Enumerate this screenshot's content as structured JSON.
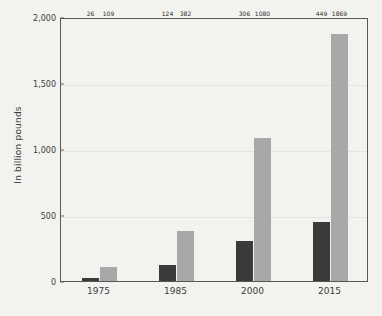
{
  "chart_data": {
    "type": "bar",
    "title": "",
    "subtitle": "",
    "xlabel": "",
    "ylabel": "In billion pounds",
    "categories": [
      "1975",
      "1985",
      "2000",
      "2015"
    ],
    "series": [
      {
        "name": "series-1",
        "color": "#3a3a3a",
        "values": [
          26,
          124,
          306,
          449
        ]
      },
      {
        "name": "series-2",
        "color": "#a8a8a8",
        "values": [
          109,
          382,
          1080,
          1869
        ]
      }
    ],
    "ylim": [
      0,
      2000
    ],
    "yticks": [
      0,
      500,
      1000,
      1500,
      2000
    ],
    "ytick_labels": [
      "0",
      "500",
      "1,000",
      "1,500",
      "2,000"
    ],
    "grid": true,
    "legend": "none",
    "data_labels": [
      [
        "26",
        "109"
      ],
      [
        "124",
        "382"
      ],
      [
        "306",
        "1080"
      ],
      [
        "449",
        "1869"
      ]
    ]
  },
  "colors": {
    "background": "#f2f2ef",
    "axis": "#575757",
    "gridline": "#e3e3e0",
    "text": "#3c3c3c",
    "bar_dark": "#3a3a3a",
    "bar_light": "#a8a8a8"
  }
}
